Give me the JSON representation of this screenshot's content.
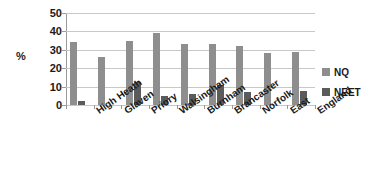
{
  "chart_data": {
    "type": "bar",
    "title": "",
    "xlabel": "",
    "ylabel": "%",
    "ylim": [
      0,
      50
    ],
    "yticks": [
      0,
      10,
      20,
      30,
      40,
      50
    ],
    "grid": true,
    "legend_position": "right",
    "categories": [
      "High Heath",
      "Glaven",
      "Priory",
      "Walsingham",
      "Burnham",
      "Brancaster",
      "Norfolk",
      "East",
      "England"
    ],
    "series": [
      {
        "name": "NQ",
        "color": "#8e8e8e",
        "values": [
          34,
          26,
          35,
          39,
          33,
          33,
          32,
          28,
          29
        ]
      },
      {
        "name": "NEET",
        "color": "#5b5b5b",
        "values": [
          2,
          0,
          12.5,
          5,
          6,
          11,
          7,
          0,
          7.5
        ]
      }
    ]
  },
  "axis": {
    "y_title": "%",
    "y_tick_labels": [
      "50",
      "40",
      "30",
      "20",
      "10",
      "0"
    ]
  },
  "legend": {
    "items": [
      {
        "label": "NQ",
        "color": "#8e8e8e"
      },
      {
        "label": "NEET",
        "color": "#5b5b5b"
      }
    ]
  },
  "colors": {
    "nq": "#8e8e8e",
    "neet": "#5b5b5b",
    "gridline": "#c8c8c8",
    "axis": "#9a9a9a",
    "text": "#1a1a1a",
    "background": "#ffffff"
  }
}
